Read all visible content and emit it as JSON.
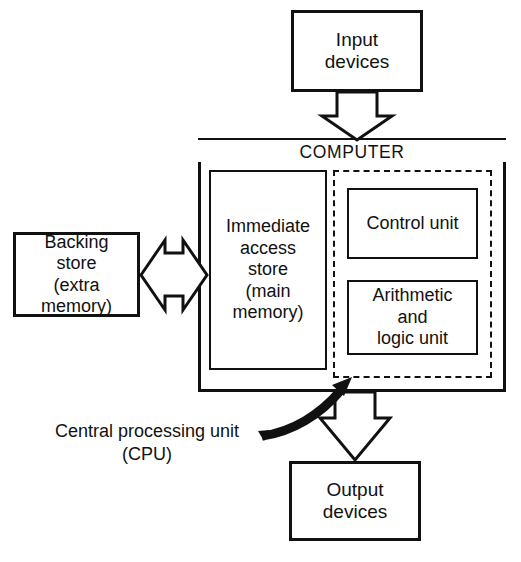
{
  "diagram": {
    "line_color": "#111111",
    "background_color": "#ffffff"
  },
  "boxes": {
    "input_devices": {
      "label": "Input\ndevices"
    },
    "computer": {
      "label": "COMPUTER"
    },
    "immediate_access_store": {
      "label": "Immediate\naccess\nstore\n(main\nmemory)"
    },
    "control_unit": {
      "label": "Control unit"
    },
    "arithmetic_logic_unit": {
      "label": "Arithmetic\nand\nlogic unit"
    },
    "backing_store": {
      "label": "Backing\nstore\n(extra\nmemory)"
    },
    "output_devices": {
      "label": "Output\ndevices"
    }
  },
  "annotations": {
    "cpu_caption": "Central processing unit\n(CPU)"
  },
  "connectors": {
    "input_to_computer": {
      "name": "block-arrow-down",
      "direction": "down",
      "from": "input_devices",
      "to": "computer"
    },
    "computer_to_output": {
      "name": "block-arrow-down",
      "direction": "down",
      "from": "computer",
      "to": "output_devices"
    },
    "backing_store_to_memory": {
      "name": "block-arrow-bidirectional",
      "direction": "both",
      "from": "backing_store",
      "to": "immediate_access_store"
    },
    "cpu_pointer": {
      "name": "curved-arrow",
      "direction": "up-right",
      "from": "cpu_caption",
      "to": "cpu_dashed_region"
    }
  }
}
